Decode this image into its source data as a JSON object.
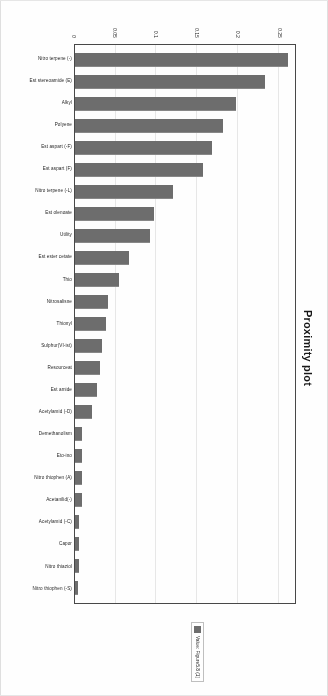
{
  "document": {
    "kind": "scanned-chart-page"
  },
  "chart_data": {
    "type": "bar",
    "title": "Proximity plot",
    "xlabel": "",
    "ylabel": "",
    "ylim": [
      0,
      0.27
    ],
    "grid": true,
    "legend_position": "right",
    "legend": [
      "Value: Figure5.8 (1)"
    ],
    "bar_color": "#6e6e6e",
    "yticks": [
      "0",
      "0.05",
      "0.1",
      "0.15",
      "0.2",
      "0.25"
    ],
    "ytick_values": [
      0,
      0.05,
      0.1,
      0.15,
      0.2,
      0.25
    ],
    "categories": [
      "Nitro terpene (-)",
      "Est stereoamide (E)",
      "Alkyl",
      "Polyene",
      "Est aspart (-F)",
      "Est aspart (F)",
      "Nitro terpene (-L)",
      "Est olenoate",
      "Utility",
      "Est ester cetate",
      "Thio",
      "Nitrosalisne",
      "Thionyl",
      "Sulphur(VI-ist)",
      "Resourceat",
      "Est amide",
      "Acetylamid (-D)",
      "Demethanolism",
      "Eto-ino",
      "Nitro thiophen (A)",
      "Acetanilid(-)",
      "Acetylamid (-C)",
      "Capor",
      "Nitro thiaziol",
      "Nitro thiophen (-S)"
    ],
    "values": [
      0.262,
      0.233,
      0.197,
      0.182,
      0.168,
      0.157,
      0.12,
      0.097,
      0.092,
      0.066,
      0.054,
      0.04,
      0.038,
      0.033,
      0.031,
      0.027,
      0.021,
      0.008,
      0.008,
      0.008,
      0.008,
      0.005,
      0.005,
      0.005,
      0.004
    ]
  }
}
